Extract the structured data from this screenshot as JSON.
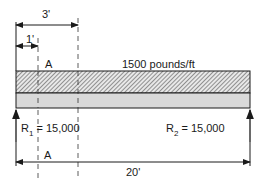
{
  "diagram": {
    "type": "simply-supported beam with uniform load",
    "load_label": "1500 pounds/ft",
    "dimensions": {
      "top_long": "3'",
      "top_short": "1'",
      "span": "20'"
    },
    "section_labels": {
      "upper": "A",
      "lower": "A"
    },
    "reactions": {
      "left": {
        "symbol": "R",
        "subscript": "1",
        "value": "= 15,000"
      },
      "right": {
        "symbol": "R",
        "subscript": "2",
        "value": "= 15,000"
      }
    },
    "colors": {
      "line": "#1a1a1a",
      "beam_fill": "#d9d9d9",
      "hatch_bg": "#e6e6e6"
    }
  }
}
